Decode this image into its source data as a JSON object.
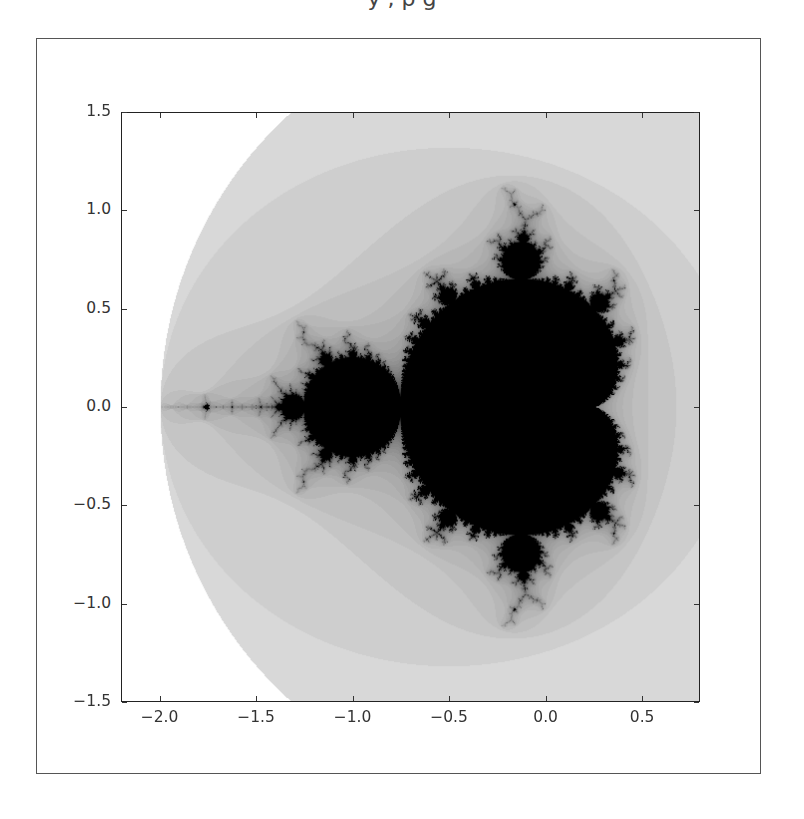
{
  "caption_fragment": "y          ,          p                          g",
  "chart_data": {
    "type": "heatmap",
    "title": "",
    "xlabel": "",
    "ylabel": "",
    "xlim": [
      -2.2,
      0.8
    ],
    "ylim": [
      -1.5,
      1.5
    ],
    "grid": false,
    "legend": null,
    "colormap": "gray_r",
    "max_iter": 60,
    "x_ticks": [
      -2.0,
      -1.5,
      -1.0,
      -0.5,
      0.0,
      0.5
    ],
    "x_tick_labels": [
      "−2.0",
      "−1.5",
      "−1.0",
      "−0.5",
      "0.0",
      "0.5"
    ],
    "y_ticks": [
      1.5,
      1.0,
      0.5,
      0.0,
      -0.5,
      -1.0,
      -1.5
    ],
    "y_tick_labels": [
      "1.5",
      "1.0",
      "0.5",
      "0.0",
      "−0.5",
      "−1.0",
      "−1.5"
    ]
  },
  "colors": {
    "in_set": "#000000",
    "background": "#ffffff",
    "axis_line": "#222222",
    "tick_text": "#333333",
    "frame": "#555555"
  }
}
